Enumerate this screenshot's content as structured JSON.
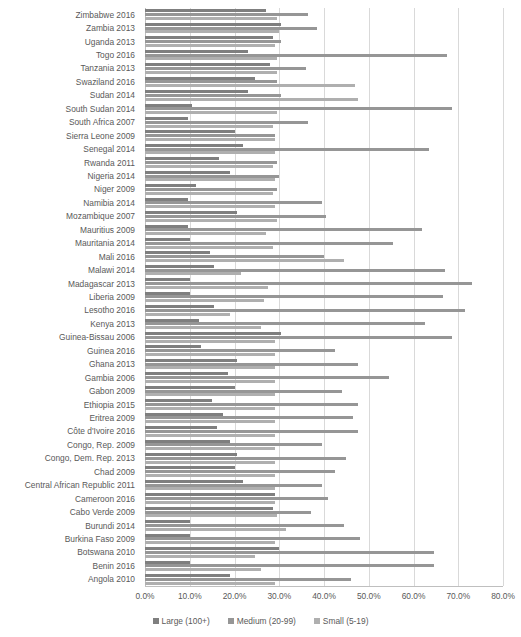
{
  "chart_data": {
    "type": "bar",
    "orientation": "horizontal",
    "title": "",
    "xlabel": "",
    "ylabel": "",
    "xlim": [
      0,
      80
    ],
    "xtick_labels": [
      "0.0%",
      "10.0%",
      "20.0%",
      "30.0%",
      "40.0%",
      "50.0%",
      "60.0%",
      "70.0%",
      "80.0%"
    ],
    "xticks": [
      0,
      10,
      20,
      30,
      40,
      50,
      60,
      70,
      80
    ],
    "grid": true,
    "legend_position": "bottom",
    "categories": [
      "Zimbabwe 2016",
      "Zambia 2013",
      "Uganda 2013",
      "Togo 2016",
      "Tanzania 2013",
      "Swaziland 2016",
      "Sudan 2014",
      "South Sudan 2014",
      "South Africa 2007",
      "Sierra Leone 2009",
      "Senegal 2014",
      "Rwanda 2011",
      "Nigeria 2014",
      "Niger 2009",
      "Namibia 2014",
      "Mozambique 2007",
      "Mauritius 2009",
      "Mauritania 2014",
      "Mali 2016",
      "Malawi 2014",
      "Madagascar 2013",
      "Liberia 2009",
      "Lesotho 2016",
      "Kenya 2013",
      "Guinea-Bissau 2006",
      "Guinea 2016",
      "Ghana 2013",
      "Gambia 2006",
      "Gabon 2009",
      "Ethiopia 2015",
      "Eritrea 2009",
      "Côte d'Ivoire 2016",
      "Congo, Rep. 2009",
      "Congo, Dem. Rep. 2013",
      "Chad 2009",
      "Central African Republic 2011",
      "Cameroon 2016",
      "Cabo Verde 2009",
      "Burundi 2014",
      "Burkina Faso 2009",
      "Botswana 2010",
      "Benin 2016",
      "Angola 2010"
    ],
    "series": [
      {
        "name": "Large (100+)",
        "color": "#7f7f7f",
        "values": [
          27.0,
          30.5,
          28.5,
          23.0,
          28.0,
          24.5,
          23.0,
          10.5,
          9.5,
          20.0,
          22.0,
          16.5,
          19.0,
          11.5,
          9.5,
          20.5,
          9.5,
          10.0,
          14.5,
          15.5,
          10.0,
          10.0,
          15.5,
          12.0,
          30.5,
          12.5,
          20.5,
          18.5,
          20.0,
          15.0,
          17.5,
          16.0,
          19.0,
          20.5,
          20.0,
          22.0,
          29.0,
          28.5,
          10.0,
          10.0,
          30.0,
          10.0,
          19.0
        ]
      },
      {
        "name": "Medium (20-99)",
        "color": "#969696",
        "values": [
          36.5,
          38.5,
          30.5,
          67.5,
          36.0,
          29.5,
          30.5,
          68.5,
          36.5,
          29.0,
          63.5,
          29.5,
          30.0,
          29.5,
          39.5,
          40.5,
          62.0,
          55.5,
          40.0,
          67.0,
          73.0,
          66.5,
          71.5,
          62.5,
          68.5,
          42.5,
          47.5,
          54.5,
          44.0,
          47.5,
          46.5,
          47.5,
          39.5,
          45.0,
          42.5,
          39.5,
          41.0,
          37.0,
          44.5,
          48.0,
          64.5,
          64.5,
          46.0
        ]
      },
      {
        "name": "Small (5-19)",
        "color": "#afafaf",
        "values": [
          29.5,
          30.0,
          29.0,
          29.5,
          29.5,
          47.0,
          47.5,
          29.5,
          28.5,
          29.0,
          29.0,
          28.5,
          29.0,
          28.5,
          29.0,
          29.5,
          27.0,
          28.5,
          44.5,
          21.5,
          27.5,
          26.5,
          19.0,
          26.0,
          29.0,
          29.0,
          29.0,
          29.0,
          29.0,
          29.0,
          29.0,
          29.0,
          29.0,
          29.0,
          29.0,
          29.0,
          29.0,
          29.5,
          31.5,
          29.0,
          24.5,
          26.0,
          29.0
        ]
      }
    ]
  },
  "legend": {
    "items": [
      {
        "label": "Large (100+)",
        "series": "large"
      },
      {
        "label": "Medium (20-99)",
        "series": "medium"
      },
      {
        "label": "Small (5-19)",
        "series": "small"
      }
    ]
  }
}
